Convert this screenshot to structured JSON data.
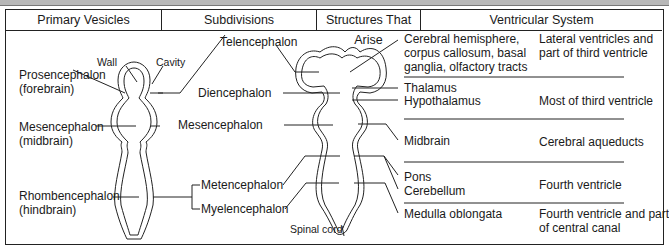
{
  "table": {
    "headers": [
      "Primary Vesicles",
      "Subdivisions",
      "Structures That Arise",
      "Ventricular System"
    ]
  },
  "primary_vesicle_diagram": {
    "wall_label": "Wall",
    "cavity_label": "Cavity",
    "vesicles": [
      {
        "name": "Prosencephalon",
        "common": "(forebrain)"
      },
      {
        "name": "Mesencephalon",
        "common": "(midbrain)"
      },
      {
        "name": "Rhombencephalon",
        "common": "(hindbrain)"
      }
    ]
  },
  "subdivisions": [
    "Telencephalon",
    "Diencephalon",
    "Mesencephalon",
    "Metencephalon",
    "Myelencephalon"
  ],
  "spinal_cord_label": "Spinal cord",
  "structures": [
    {
      "lines": [
        "Cerebral hemisphere,",
        "corpus callosum, basal",
        "ganglia, olfactory tracts"
      ]
    },
    {
      "lines": [
        "Thalamus",
        "Hypothalamus"
      ]
    },
    {
      "lines": [
        "Midbrain"
      ]
    },
    {
      "lines": [
        "Pons",
        "Cerebellum"
      ]
    },
    {
      "lines": [
        "Medulla oblongata"
      ]
    }
  ],
  "ventricular_system": [
    {
      "lines": [
        "Lateral ventricles and",
        "part of third ventricle"
      ]
    },
    {
      "lines": [
        "Most of third ventricle"
      ]
    },
    {
      "lines": [
        "Cerebral aqueducts"
      ]
    },
    {
      "lines": [
        "Fourth ventricle"
      ]
    },
    {
      "lines": [
        "Fourth ventricle and part",
        "of central canal"
      ]
    }
  ]
}
